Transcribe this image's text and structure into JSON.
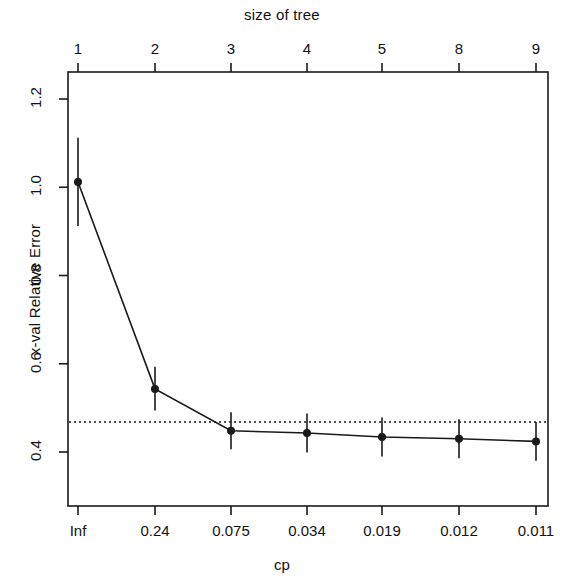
{
  "chart_data": {
    "type": "line",
    "title": "",
    "xlabel": "cp",
    "ylabel": "x-val Relative Error",
    "secondary_xlabel": "size of tree",
    "x_tick_labels": [
      "Inf",
      "0.24",
      "0.075",
      "0.034",
      "0.019",
      "0.012",
      "0.011"
    ],
    "top_tick_labels": [
      "1",
      "2",
      "3",
      "4",
      "5",
      "8",
      "9"
    ],
    "y_tick_labels": [
      "0.4",
      "0.6",
      "0.8",
      "1.0",
      "1.2"
    ],
    "y_tick_values": [
      0.4,
      0.6,
      0.8,
      1.0,
      1.2
    ],
    "ylim": [
      0.32,
      1.26
    ],
    "grid": false,
    "legend": "none",
    "categories": [
      "Inf",
      "0.24",
      "0.075",
      "0.034",
      "0.019",
      "0.012",
      "0.011"
    ],
    "sizes_of_tree": [
      1,
      2,
      3,
      4,
      5,
      8,
      9
    ],
    "values": [
      1.012,
      0.543,
      0.448,
      0.443,
      0.434,
      0.43,
      0.424
    ],
    "error_upper": [
      1.112,
      0.593,
      0.49,
      0.487,
      0.478,
      0.474,
      0.468
    ],
    "error_lower": [
      0.912,
      0.494,
      0.406,
      0.399,
      0.39,
      0.386,
      0.38
    ],
    "reference_line": {
      "y": 0.468,
      "style": "dotted"
    },
    "marker": "circle",
    "point_count": 7
  },
  "axes": {
    "top_title": "size of tree",
    "bottom_title": "cp",
    "y_title": "x-val Relative Error"
  },
  "colors": {
    "line": "#1a1a1a",
    "axis": "#1a1a1a",
    "background": "#ffffff"
  }
}
